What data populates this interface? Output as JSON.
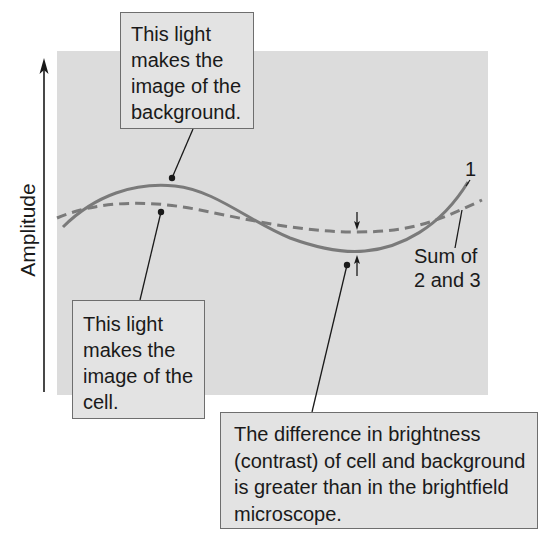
{
  "diagram": {
    "type": "phase-contrast wave interference illustration",
    "axis": {
      "y_label": "Amplitude",
      "direction": "up"
    },
    "curves": [
      {
        "id": "1",
        "label": "1",
        "style": "solid",
        "color": "#7a7a7a"
      },
      {
        "id": "sum",
        "label_lines": [
          "Sum of",
          "2 and 3"
        ],
        "style": "dashed",
        "color": "#7a7a7a"
      }
    ],
    "callouts": {
      "background": {
        "lines": [
          "This light",
          "makes the",
          "image of the",
          "background."
        ]
      },
      "cell": {
        "lines": [
          "This light",
          "makes the",
          "image of the",
          "cell."
        ]
      },
      "difference": {
        "lines": [
          "The difference in brightness",
          "(contrast) of cell and background",
          "is greater than in the brightfield",
          "microscope."
        ]
      }
    },
    "colors": {
      "panel": "#dcdcdc",
      "callout_fill": "#e3e3e3",
      "callout_border": "#6e6e6e",
      "curve": "#7a7a7a",
      "ink": "#1a1a1a"
    }
  }
}
